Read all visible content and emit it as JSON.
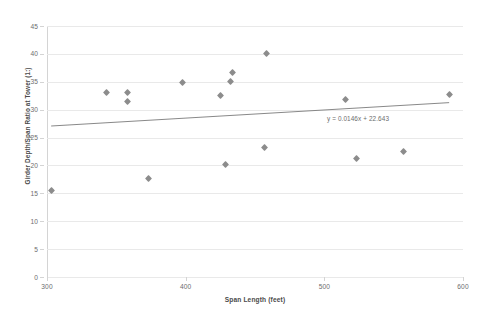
{
  "chart_data": {
    "type": "scatter",
    "title": "",
    "xlabel": "Span Length (feet)",
    "ylabel": "Girder Depth/Span Ratio at Tower (1:)",
    "xlim": [
      300,
      600
    ],
    "ylim": [
      0,
      45
    ],
    "xticks": [
      300,
      400,
      500,
      600
    ],
    "yticks": [
      0,
      5,
      10,
      15,
      20,
      25,
      30,
      35,
      40,
      45
    ],
    "grid": true,
    "legend": false,
    "marker_color": "#8c8c8c",
    "gridline_color": "#e9e9e9",
    "trendline_color": "#7a7a7a",
    "annotations": [
      {
        "text": "y = 0.0146x + 22.643",
        "x": 520,
        "y": 26.5
      }
    ],
    "trendline": {
      "slope": 0.0146,
      "intercept": 22.643,
      "x_start": 303,
      "x_end": 590,
      "y_start": 27.07,
      "y_end": 31.26
    },
    "points": [
      {
        "x": 303,
        "y": 15.5
      },
      {
        "x": 343,
        "y": 33.0
      },
      {
        "x": 358,
        "y": 33.0
      },
      {
        "x": 358,
        "y": 31.5
      },
      {
        "x": 373,
        "y": 17.6
      },
      {
        "x": 398,
        "y": 34.8
      },
      {
        "x": 425,
        "y": 32.5
      },
      {
        "x": 429,
        "y": 20.2
      },
      {
        "x": 432,
        "y": 35.0
      },
      {
        "x": 434,
        "y": 36.7
      },
      {
        "x": 457,
        "y": 23.2
      },
      {
        "x": 458,
        "y": 40.0
      },
      {
        "x": 515,
        "y": 31.8
      },
      {
        "x": 523,
        "y": 21.3
      },
      {
        "x": 557,
        "y": 22.5
      },
      {
        "x": 590,
        "y": 32.7
      }
    ]
  },
  "axis": {
    "y_tick_labels": [
      "45",
      "40",
      "35",
      "30",
      "25",
      "20",
      "15",
      "10",
      "5",
      "0"
    ],
    "x_tick_labels": [
      "300",
      "400",
      "500",
      "600"
    ],
    "y_title": "Girder Depth/Span Ratio at Tower (1:)",
    "x_title": "Span Length (feet)"
  },
  "equation": {
    "text": "y = 0.0146x + 22.643"
  }
}
